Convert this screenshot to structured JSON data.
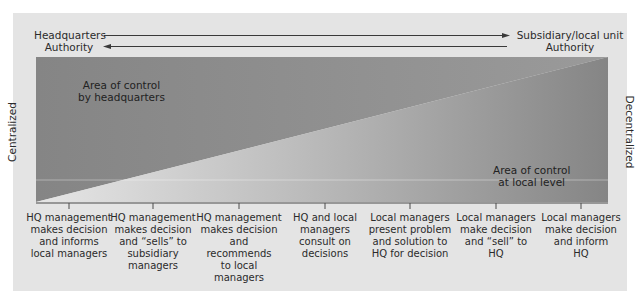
{
  "header": {
    "left_label_line1": "Headquarters",
    "left_label_line2": "Authority",
    "right_label_line1": "Subsidiary/local unit",
    "right_label_line2": "Authority"
  },
  "axis": {
    "left": "Centralized",
    "right": "Decentralized"
  },
  "areas": {
    "hq_line1": "Area of control",
    "hq_line2": "by headquarters",
    "local_line1": "Area of control",
    "local_line2": "at local level"
  },
  "captions": [
    {
      "lines": [
        "HQ management",
        "makes decision",
        "and informs",
        "local managers"
      ]
    },
    {
      "lines": [
        "HQ management",
        "makes decision",
        "and “sells” to",
        "subsidiary",
        "managers"
      ]
    },
    {
      "lines": [
        "HQ management",
        "makes decision",
        "and recommends",
        "to local managers"
      ]
    },
    {
      "lines": [
        "HQ and local",
        "managers",
        "consult on",
        "decisions"
      ]
    },
    {
      "lines": [
        "Local managers",
        "present problem",
        "and solution to",
        "HQ for decision"
      ]
    },
    {
      "lines": [
        "Local managers",
        "make decision",
        "and “sell” to",
        "HQ"
      ]
    },
    {
      "lines": [
        "Local managers",
        "make decision",
        "and inform",
        "HQ"
      ]
    }
  ],
  "colors": {
    "panel": "#e4e4e4",
    "hq_area": "#8a8a8a",
    "local_area_light": "#d2d2d2",
    "local_area_dark": "#8c8c8c",
    "line": "#3a3a3a"
  }
}
